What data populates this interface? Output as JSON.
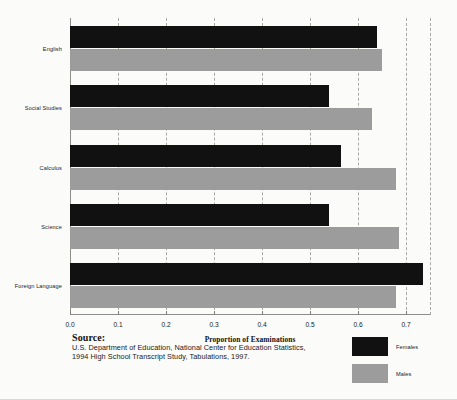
{
  "chart_data": {
    "type": "bar",
    "orientation": "horizontal",
    "title": "",
    "xlabel": "Proportion of Examinations",
    "ylabel": "",
    "categories": [
      "English",
      "Social Studies",
      "Calculus",
      "Science",
      "Foreign Language"
    ],
    "series": [
      {
        "name": "Females",
        "color": "#111111",
        "values": [
          0.64,
          0.54,
          0.565,
          0.54,
          0.735
        ]
      },
      {
        "name": "Males",
        "color": "#9c9c9c",
        "values": [
          0.65,
          0.63,
          0.68,
          0.685,
          0.68
        ]
      }
    ],
    "xlim": [
      0.0,
      0.75
    ],
    "xticks": [
      "0.0",
      "0.1",
      "0.2",
      "0.3",
      "0.4",
      "0.5",
      "0.6",
      "0.7"
    ],
    "xtick_values": [
      0.0,
      0.1,
      0.2,
      0.3,
      0.4,
      0.5,
      0.6,
      0.7
    ],
    "gridlines": [
      0.1,
      0.2,
      0.3,
      0.4,
      0.5,
      0.6,
      0.7,
      0.75
    ],
    "grid": true,
    "legend_position": "bottom-right"
  },
  "source": {
    "heading": "Source:",
    "lines": [
      "U.S. Department of Education, National Center for Education Statistics,",
      "1994 High School Transcript Study, Tabulations, 1997."
    ]
  },
  "legend": {
    "entries": [
      {
        "label": "Females",
        "color": "#111111"
      },
      {
        "label": "Males",
        "color": "#9c9c9c"
      }
    ]
  }
}
